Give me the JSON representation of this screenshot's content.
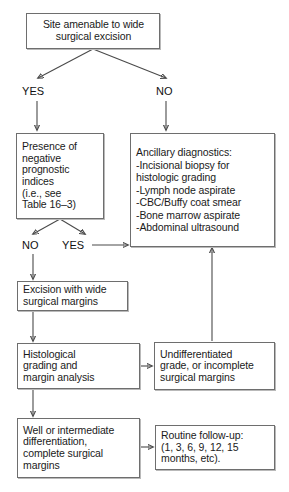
{
  "diagram": {
    "accent_color": "#6e6e6e",
    "line_color": "#4a4a4a",
    "background_color": "#ffffff",
    "nodes": {
      "site_amenable": "Site amenable to wide\nsurgical excision",
      "negative_prognostic": "Presence of\nnegative\nprognostic\nindices\n(i.e., see\nTable 16–3)",
      "ancillary": "Ancillary diagnostics:\n  -Incisional biopsy for\n    histologic grading\n  -Lymph node aspirate\n  -CBC/Buffy coat smear\n  -Bone marrow aspirate\n  -Abdominal ultrasound",
      "excision": "Excision with wide\nsurgical margins",
      "histological": "Histological\ngrading and\nmargin analysis",
      "undifferentiated": "Undifferentiated\ngrade, or incomplete\nsurgical margins",
      "well_intermediate": "Well or intermediate\ndifferentiation,\ncomplete surgical\nmargins",
      "routine_followup": "Routine follow-up:\n(1, 3, 6, 9, 12, 15\nmonths, etc)."
    },
    "edge_labels": {
      "top_yes": "YES",
      "top_no": "NO",
      "mid_no": "NO",
      "mid_yes": "YES"
    }
  }
}
